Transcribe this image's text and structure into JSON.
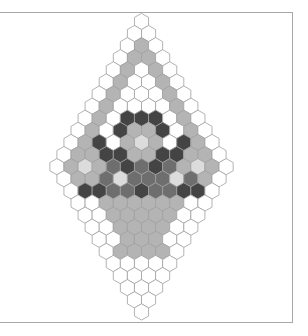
{
  "diagram": {
    "type": "hexagonal-grid",
    "shape": "rhombus",
    "rows": 25,
    "max_row_width": 13,
    "legend_colors": {
      "W": "#ffffff",
      "L": "#dcdcdc",
      "G": "#b4b4b4",
      "M": "#6e6e6e",
      "D": "#444444"
    },
    "stroke": "#a0a0a0",
    "cells": [
      "W",
      "WW",
      "WGW",
      "WGGW",
      "WGWGW",
      "WGWWGW",
      "WGWWWGW",
      "WGWWWWGW",
      "WGWDDDWGW",
      "WGWDGGDWGW",
      "WGDWGLGWDGW",
      "WGGDDGGDDGGW",
      "WGLGMDMDMGLGW",
      "WGGMLMMMLMGW",
      "WDDMMDMMDDW",
      "WWGGGGGGWW",
      "WWGGGGGWW",
      "WWGGGGWW",
      "WWGGGWW",
      "WGGGGW",
      "WWWWW",
      "WWWW",
      "WWW",
      "WW",
      "W"
    ]
  }
}
